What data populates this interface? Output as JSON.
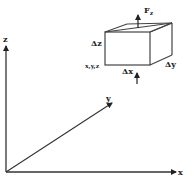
{
  "diagram": {
    "axes": {
      "x_label": "x",
      "y_label": "y",
      "z_label": "z"
    },
    "element": {
      "corner_label": "x,y,z",
      "dx_label": "Δx",
      "dy_label": "Δy",
      "dz_label": "Δz"
    },
    "force": {
      "label_main": "F",
      "label_sub": "z"
    },
    "colors": {
      "line": "#222222",
      "background": "#ffffff"
    }
  }
}
